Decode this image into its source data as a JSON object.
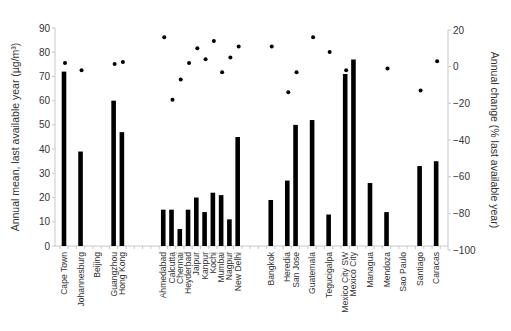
{
  "chart_data": {
    "type": "bar",
    "title": "",
    "xlabel": "",
    "ylabel": "Annual mean, last available year (µg/m³)",
    "ylabel_right": "Annual change (% last available year)",
    "ylim": [
      0,
      90
    ],
    "ylim_right": [
      -100,
      20
    ],
    "yticks": [
      0,
      10,
      20,
      30,
      40,
      50,
      60,
      70,
      80,
      90
    ],
    "yticks_right": [
      20,
      0,
      -20,
      -40,
      -60,
      -80,
      -100
    ],
    "grid": false,
    "legend": null,
    "categories": [
      "Cape Town",
      "Johannesburg",
      "Beijing",
      "Guangzhou",
      "Hong Kong",
      "Ahmedabad",
      "Calcutta",
      "Chennai",
      "Heyderbad",
      "Jaipur",
      "Kanpur",
      "Kochi",
      "Mumbai",
      "Nagpur",
      "New Delhi",
      "Bangkok",
      "Heredia",
      "San Jose",
      "Guatemala",
      "Tegucigalpa",
      "Mexico City SW",
      "Mexico City",
      "Managua",
      "Mendoza",
      "Sao Paulo",
      "Santiago",
      "Caracas"
    ],
    "slots": [
      0,
      2,
      4,
      6,
      7,
      12,
      13,
      14,
      15,
      16,
      17,
      18,
      19,
      20,
      21,
      25,
      27,
      28,
      30,
      32,
      34,
      35,
      37,
      39,
      41,
      43,
      45
    ],
    "series": [
      {
        "name": "Annual mean, last available year (µg/m³)",
        "type": "bar",
        "axis": "left",
        "values": [
          72,
          39,
          null,
          60,
          47,
          15,
          15,
          7,
          15,
          20,
          14,
          22,
          21,
          11,
          45,
          19,
          27,
          50,
          52,
          13,
          71,
          77,
          26,
          14,
          null,
          33,
          35
        ]
      },
      {
        "name": "Annual change (% last available year)",
        "type": "scatter",
        "axis": "right",
        "values": [
          2,
          -2,
          null,
          1.5,
          2.5,
          16,
          -18,
          -7,
          2,
          10,
          4,
          14,
          -3,
          5,
          11,
          11,
          -14,
          -3,
          16,
          8,
          -2,
          null,
          null,
          -1,
          null,
          -13,
          3
        ]
      }
    ]
  }
}
